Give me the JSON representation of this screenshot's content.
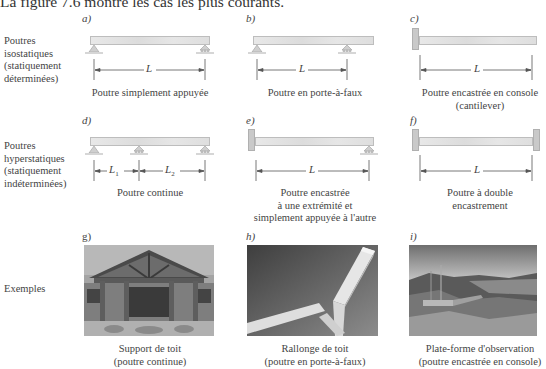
{
  "intro_text": "La figure 7.6 montre les cas les plus courants.",
  "rows": [
    {
      "label_lines": [
        "Poutres",
        "isostatiques",
        "(statiquement",
        "déterminées)"
      ]
    },
    {
      "label_lines": [
        "Poutres",
        "hyperstatiques",
        "(statiquement",
        "indéterminées)"
      ]
    },
    {
      "label_lines": [
        "Exemples"
      ]
    }
  ],
  "panels": [
    {
      "letter": "a)",
      "caption_lines": [
        "Poutre simplement appuyée"
      ],
      "dims": [
        "L"
      ]
    },
    {
      "letter": "b)",
      "caption_lines": [
        "Poutre en porte-à-faux"
      ],
      "dims": [
        "L"
      ]
    },
    {
      "letter": "c)",
      "caption_lines": [
        "Poutre encastrée en console",
        "(cantilever)"
      ],
      "dims": [
        "L"
      ]
    },
    {
      "letter": "d)",
      "caption_lines": [
        "Poutre continue"
      ],
      "dims": [
        "L1",
        "L2"
      ]
    },
    {
      "letter": "e)",
      "caption_lines": [
        "Poutre encastrée",
        "à une extrémité et",
        "simplement appuyée à l'autre"
      ],
      "dims": [
        "L"
      ]
    },
    {
      "letter": "f)",
      "caption_lines": [
        "Poutre à double",
        "encastrement"
      ],
      "dims": [
        "L"
      ]
    },
    {
      "letter": "g)",
      "caption_lines": [
        "Support de toit",
        "(poutre continue)"
      ],
      "photo": "roof-support-photo"
    },
    {
      "letter": "h)",
      "caption_lines": [
        "Rallonge de toit",
        "(poutre en porte-à-faux)"
      ],
      "photo": "roof-extension-photo"
    },
    {
      "letter": "i)",
      "caption_lines": [
        "Plate-forme d'observation",
        "(poutre encastrée en console)"
      ],
      "photo": "observation-platform-photo"
    }
  ],
  "dim_labels": {
    "L": "L",
    "L1": "L",
    "L1_sub": "1",
    "L2": "L",
    "L2_sub": "2"
  }
}
